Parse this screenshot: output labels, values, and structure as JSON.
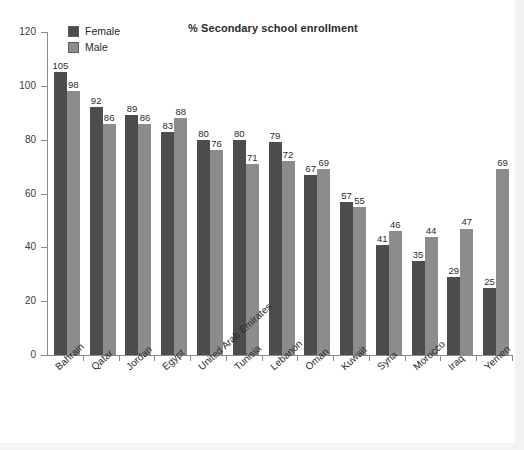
{
  "chart_data": {
    "type": "bar",
    "title": "% Secondary school enrollment",
    "xlabel": "",
    "ylabel": "",
    "ylim": [
      0,
      120
    ],
    "yticks": [
      0,
      20,
      40,
      60,
      80,
      100,
      120
    ],
    "grid": false,
    "legend_position": "top-left",
    "categories": [
      "Bahrain",
      "Qatar",
      "Jordan",
      "Egypt",
      "United Arab Emirates",
      "Tunisia",
      "Lebanon",
      "Oman",
      "Kuwait",
      "Syria",
      "Morocco",
      "Iraq",
      "Yemen"
    ],
    "series": [
      {
        "name": "Female",
        "color": "#4d4d4d",
        "values": [
          105,
          92,
          89,
          83,
          80,
          80,
          79,
          67,
          57,
          41,
          35,
          29,
          25
        ]
      },
      {
        "name": "Male",
        "color": "#8c8c8c",
        "values": [
          98,
          86,
          86,
          88,
          76,
          71,
          72,
          69,
          55,
          46,
          44,
          47,
          69
        ]
      }
    ]
  },
  "legend": {
    "items": [
      {
        "label": "Female",
        "swatch": "female"
      },
      {
        "label": "Male",
        "swatch": "male"
      }
    ]
  },
  "colors": {
    "female": "#4d4d4d",
    "male": "#8c8c8c",
    "axis": "#8a8a8a",
    "text": "#2b2b2b",
    "background": "#ffffff"
  }
}
